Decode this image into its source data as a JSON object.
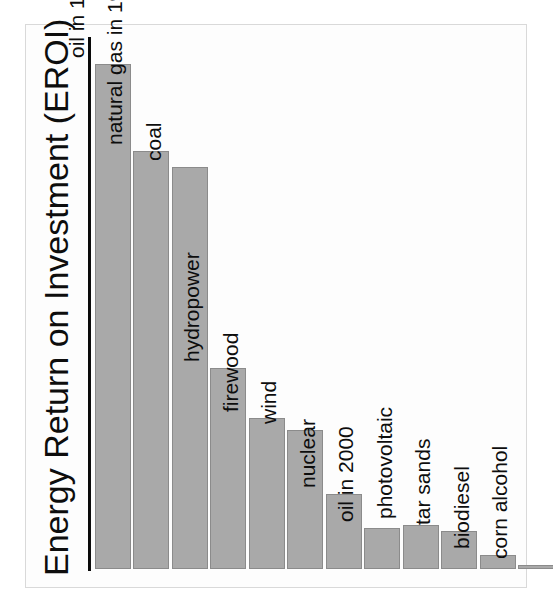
{
  "chart_data": {
    "type": "bar",
    "title": "",
    "ylabel": "Energy Return on Investment (EROI)",
    "xlabel": "",
    "grid": false,
    "legend": false,
    "axis_style": {
      "y_axis_line": true,
      "x_axis_ticks": false,
      "y_axis_ticks": false,
      "frame_box": true
    },
    "bar_fill_color": "#a9a9a9",
    "bar_border_color": "#8b8b8b",
    "axis_color": "#0a0a0a",
    "background_color": "#fdfdfd",
    "label_orientation": "rotated-90-ccw",
    "ylim": [
      0,
      115
    ],
    "categories": [
      "oil in 1930",
      "natural gas in 1930",
      "coal",
      "hydropower",
      "firewood",
      "wind",
      "nuclear",
      "oil in 2000",
      "photovoltaic",
      "tar sands",
      "biodiesel",
      "corn alcohol"
    ],
    "values": [
      100,
      80,
      77,
      43,
      32,
      29,
      15,
      8,
      8,
      8,
      3,
      1
    ],
    "bars": [
      {
        "label": "oil in 1930",
        "value": 100,
        "pixel_top": 64,
        "pixel_height": 505
      },
      {
        "label": "natural gas in 1930",
        "value": 80,
        "pixel_top": 151,
        "pixel_height": 418
      },
      {
        "label": "coal",
        "value": 77,
        "pixel_top": 167,
        "pixel_height": 402
      },
      {
        "label": "hydropower",
        "value": 43,
        "pixel_top": 368,
        "pixel_height": 201
      },
      {
        "label": "firewood",
        "value": 32,
        "pixel_top": 418,
        "pixel_height": 151
      },
      {
        "label": "wind",
        "value": 29,
        "pixel_top": 430,
        "pixel_height": 139
      },
      {
        "label": "nuclear",
        "value": 15,
        "pixel_top": 494,
        "pixel_height": 75
      },
      {
        "label": "oil in 2000",
        "value": 8,
        "pixel_top": 528,
        "pixel_height": 41
      },
      {
        "label": "photovoltaic",
        "value": 8,
        "pixel_top": 525,
        "pixel_height": 44
      },
      {
        "label": "tar sands",
        "value": 8,
        "pixel_top": 531,
        "pixel_height": 38
      },
      {
        "label": "biodiesel",
        "value": 3,
        "pixel_top": 555,
        "pixel_height": 14
      },
      {
        "label": "corn alcohol",
        "value": 1,
        "pixel_top": 566,
        "pixel_height": 4
      }
    ]
  },
  "figure": {
    "axis_title": "Energy Return on Investment (EROI)"
  }
}
